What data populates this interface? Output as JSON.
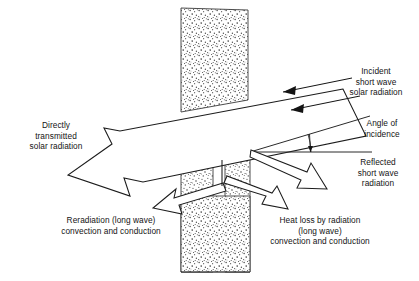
{
  "figure": {
    "type": "schematic-diagram"
  },
  "labels": {
    "incident": "Incident\nshort wave\nsolar radiation",
    "angle_of_incidence": "Angle of\nincidence",
    "reflected": "Reflected\nshort wave\nradiation",
    "directly_transmitted": "Directly\ntransmitted\nsolar radiation",
    "reradiation": "Reradiation (long wave)\nconvection and conduction",
    "heat_loss": "Heat loss by radiation\n(long wave)\nconvection and conduction"
  },
  "elements": {
    "wall_name": "wall",
    "beam_name": "transmitted-beam-arrow",
    "incident_rays_count": 2,
    "hollow_arrows": [
      "reflected-short-wave-arrow",
      "reradiation-arrow",
      "heat-loss-arrow"
    ]
  },
  "colors": {
    "background": "#ffffff",
    "ink": "#1c1c1c",
    "stipple": "#555555",
    "text": "#141414"
  }
}
